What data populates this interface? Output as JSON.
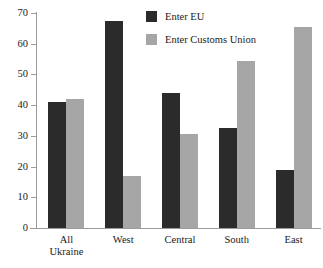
{
  "chart_data": {
    "type": "bar",
    "title": "",
    "subtitle": "",
    "xlabel": "",
    "ylabel": "",
    "ylim": [
      0,
      70
    ],
    "yticks": [
      0,
      10,
      20,
      30,
      40,
      50,
      60,
      70
    ],
    "grid": false,
    "legend_position": "top-center",
    "categories": [
      "All Ukraine",
      "West",
      "Central",
      "South",
      "East"
    ],
    "category_lines": [
      [
        "All",
        "Ukraine"
      ],
      [
        "West"
      ],
      [
        "Central"
      ],
      [
        "South"
      ],
      [
        "East"
      ]
    ],
    "series": [
      {
        "name": "Enter EU",
        "color": "#2b2b2b",
        "values": [
          41,
          67.5,
          44,
          32.5,
          19
        ]
      },
      {
        "name": "Enter Customs Union",
        "color": "#a6a6a6",
        "values": [
          42,
          17,
          30.5,
          54.5,
          65.5
        ]
      }
    ]
  },
  "legend": {
    "items": [
      {
        "label": "Enter EU",
        "swatch": "legend-swatch-eu"
      },
      {
        "label": "Enter Customs Union",
        "swatch": "legend-swatch-customs-union"
      }
    ]
  },
  "axis": {
    "y_tick_labels": [
      "70",
      "60",
      "50",
      "40",
      "30",
      "20",
      "10",
      "0"
    ]
  },
  "colors": {
    "series_eu": "#2b2b2b",
    "series_customs_union": "#a6a6a6",
    "axis": "#9b9b9b",
    "text": "#1a1a1a",
    "background": "#ffffff"
  }
}
